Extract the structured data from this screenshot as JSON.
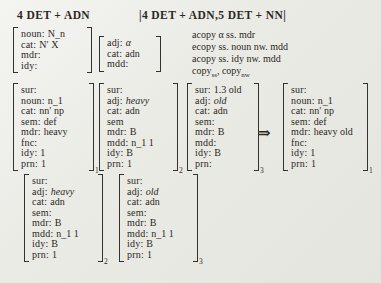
{
  "headers": {
    "left": "4 DET + ADN",
    "right": "|4 DET + ADN,5 DET + NN|"
  },
  "rules": {
    "line1": "acopy α ss. mdr",
    "line2": "ecopy ss. noun nw. mdd",
    "line3": "acopy ss. idy nw. mdd",
    "copy1": "copy",
    "copy1_sub": "ss",
    "copy_sep": ", ",
    "copy2": "copy",
    "copy2_sub": "nw"
  },
  "arrow": "⇒",
  "avms": {
    "a": {
      "sub": "",
      "lines": [
        {
          "k": "noun:",
          "v": "N_n"
        },
        {
          "k": "cat:",
          "v": "N′ X"
        },
        {
          "k": "mdr:",
          "v": ""
        },
        {
          "k": "idy:",
          "v": ""
        }
      ]
    },
    "b": {
      "sub": "",
      "lines": [
        {
          "k": "adj:",
          "v": "α",
          "it": true
        },
        {
          "k": "cat:",
          "v": "adn"
        },
        {
          "k": "mdd:",
          "v": ""
        }
      ]
    },
    "c": {
      "sub": "1",
      "lines": [
        {
          "k": "sur:",
          "v": ""
        },
        {
          "k": "noun:",
          "v": "n_1"
        },
        {
          "k": "cat:",
          "v": "nn′ np"
        },
        {
          "k": "sem:",
          "v": "def"
        },
        {
          "k": "mdr:",
          "v": "heavy"
        },
        {
          "k": "fnc:",
          "v": ""
        },
        {
          "k": "idy:",
          "v": "1"
        },
        {
          "k": "prn:",
          "v": "1"
        }
      ]
    },
    "d": {
      "sub": "2",
      "lines": [
        {
          "k": "sur:",
          "v": ""
        },
        {
          "k": "adj:",
          "v": "heavy",
          "it": true
        },
        {
          "k": "cat:",
          "v": "adn"
        },
        {
          "k": "sem",
          "v": ""
        },
        {
          "k": "mdr:",
          "v": "B"
        },
        {
          "k": "mdd:",
          "v": "n_1 1"
        },
        {
          "k": "idy:",
          "v": "B"
        },
        {
          "k": "prn:",
          "v": "1"
        }
      ]
    },
    "e": {
      "sub": "3",
      "lines": [
        {
          "k": "sur:",
          "v": "1.3 old"
        },
        {
          "k": "adj:",
          "v": "old",
          "it": true
        },
        {
          "k": "cat:",
          "v": "adn"
        },
        {
          "k": "sem:",
          "v": ""
        },
        {
          "k": "mdr:",
          "v": "B"
        },
        {
          "k": "mdd:",
          "v": ""
        },
        {
          "k": "idy:",
          "v": "B"
        },
        {
          "k": "prn:",
          "v": ""
        }
      ]
    },
    "f": {
      "sub": "1",
      "lines": [
        {
          "k": "sur:",
          "v": ""
        },
        {
          "k": "noun:",
          "v": "n_1"
        },
        {
          "k": "cat:",
          "v": "nn′ np"
        },
        {
          "k": "sem:",
          "v": "def"
        },
        {
          "k": "mdr:",
          "v": "heavy old"
        },
        {
          "k": "fnc:",
          "v": ""
        },
        {
          "k": "idy:",
          "v": "1"
        },
        {
          "k": "prn:",
          "v": "1"
        }
      ]
    },
    "g": {
      "sub": "2",
      "lines": [
        {
          "k": "sur:",
          "v": ""
        },
        {
          "k": "adj:",
          "v": "heavy",
          "it": true
        },
        {
          "k": "cat:",
          "v": "adn"
        },
        {
          "k": "sem:",
          "v": ""
        },
        {
          "k": "mdr:",
          "v": "B"
        },
        {
          "k": "mdd:",
          "v": "n_1 1"
        },
        {
          "k": "idy:",
          "v": "B"
        },
        {
          "k": "prn:",
          "v": "1"
        }
      ]
    },
    "h": {
      "sub": "3",
      "lines": [
        {
          "k": "sur:",
          "v": ""
        },
        {
          "k": "adj:",
          "v": "old",
          "it": true
        },
        {
          "k": "cat:",
          "v": "adn"
        },
        {
          "k": "sem:",
          "v": ""
        },
        {
          "k": "mdr:",
          "v": "B"
        },
        {
          "k": "mdd:",
          "v": "n_1 1"
        },
        {
          "k": "idy:",
          "v": "B"
        },
        {
          "k": "prn:",
          "v": "1"
        }
      ]
    }
  }
}
